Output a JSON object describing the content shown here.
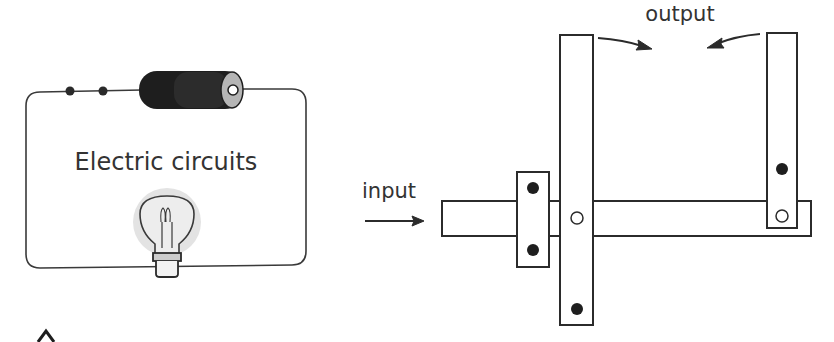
{
  "left_panel": {
    "title": "Electric circuits"
  },
  "right_panel": {
    "input_label": "input",
    "output_label": "output"
  },
  "colors": {
    "line": "#2b2b2b",
    "battery_dark": "#1e1e1e",
    "battery_mid": "#2a2a2a",
    "battery_cap": "#b8b8b8",
    "bulb_glow": "#e6e6e6",
    "text": "#333333"
  }
}
